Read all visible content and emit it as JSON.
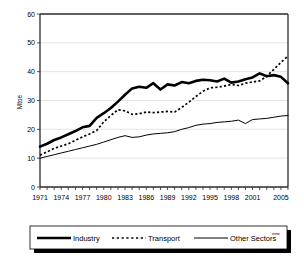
{
  "chart_data": {
    "type": "line",
    "title": "",
    "xlabel": "",
    "ylabel": "Mtoe",
    "ylim": [
      0,
      60
    ],
    "xlim": [
      1971,
      2006
    ],
    "grid": true,
    "legend_position": "bottom",
    "yticks": [
      "0",
      "10",
      "20",
      "30",
      "40",
      "50",
      "60"
    ],
    "xticks": [
      "1971",
      "1974",
      "1977",
      "1980",
      "1983",
      "1986",
      "1989",
      "1992",
      "1995",
      "1998",
      "2001",
      "2005"
    ],
    "x": [
      1971,
      1972,
      1973,
      1974,
      1975,
      1976,
      1977,
      1978,
      1979,
      1980,
      1981,
      1982,
      1983,
      1984,
      1985,
      1986,
      1987,
      1988,
      1989,
      1990,
      1991,
      1992,
      1993,
      1994,
      1995,
      1996,
      1997,
      1998,
      1999,
      2000,
      2001,
      2002,
      2003,
      2004,
      2005,
      2006
    ],
    "series": [
      {
        "name": "Industry",
        "style": "thick-solid",
        "values": [
          14.0,
          15.0,
          16.3,
          17.2,
          18.3,
          19.4,
          20.7,
          21.2,
          24.0,
          25.6,
          27.4,
          29.6,
          32.0,
          34.2,
          34.8,
          34.4,
          36.0,
          33.8,
          35.6,
          35.2,
          36.4,
          36.0,
          36.8,
          37.2,
          37.0,
          36.6,
          37.6,
          36.2,
          36.6,
          37.4,
          38.0,
          39.4,
          38.4,
          38.8,
          38.2,
          36.0
        ]
      },
      {
        "name": "Transport",
        "style": "dotted",
        "values": [
          11.0,
          12.2,
          13.4,
          14.2,
          15.0,
          16.2,
          17.4,
          18.4,
          19.6,
          22.6,
          24.8,
          26.8,
          26.4,
          25.2,
          25.4,
          26.0,
          25.8,
          26.0,
          26.2,
          26.0,
          27.6,
          29.4,
          31.4,
          33.2,
          34.4,
          34.6,
          35.0,
          35.6,
          35.2,
          36.0,
          36.4,
          36.8,
          38.4,
          40.8,
          43.2,
          45.4
        ]
      },
      {
        "name": "Other Sectors",
        "name_suffix": "****",
        "style": "thin-solid",
        "values": [
          10.0,
          10.6,
          11.2,
          11.8,
          12.4,
          13.0,
          13.6,
          14.2,
          14.8,
          15.6,
          16.4,
          17.2,
          17.8,
          17.2,
          17.4,
          18.0,
          18.4,
          18.6,
          18.8,
          19.2,
          20.0,
          20.6,
          21.4,
          21.8,
          22.0,
          22.4,
          22.6,
          22.8,
          23.2,
          22.0,
          23.4,
          23.6,
          23.8,
          24.2,
          24.6,
          24.8
        ]
      }
    ]
  },
  "legend": {
    "items": [
      {
        "label": "Industry",
        "suffix": ""
      },
      {
        "label": "Transport",
        "suffix": ""
      },
      {
        "label": "Other Sectors",
        "suffix": "****"
      }
    ]
  }
}
